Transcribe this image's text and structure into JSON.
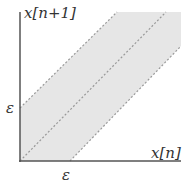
{
  "diagram": {
    "y_axis_label": "x[n+1]",
    "x_axis_label": "x[n]",
    "y_tick_label": "ε",
    "x_tick_label": "ε",
    "colors": {
      "band_fill": "#e6e6e6",
      "axis": "#555555",
      "dashed_line": "#999999"
    },
    "elements": [
      {
        "name": "upper-boundary",
        "description": "dashed line y = x + ε"
      },
      {
        "name": "diagonal",
        "description": "dashed line y = x"
      },
      {
        "name": "lower-boundary",
        "description": "dashed line y = x − ε"
      },
      {
        "name": "band",
        "description": "shaded region |y − x| ≤ ε"
      }
    ]
  }
}
